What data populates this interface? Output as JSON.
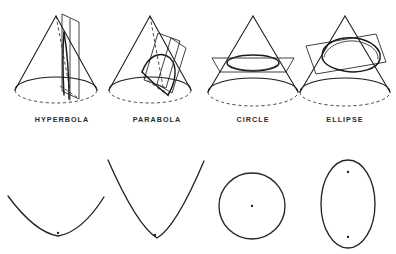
{
  "figure": {
    "background_color": "#ffffff",
    "ink_color": "#1a1a1a",
    "width": 396,
    "height": 254
  },
  "labels": [
    {
      "id": "hyperbola",
      "text": "HYPERBOLA",
      "x": 62,
      "y": 122
    },
    {
      "id": "parabola",
      "text": "PARABOLA",
      "x": 157,
      "y": 122
    },
    {
      "id": "circle",
      "text": "CIRCLE",
      "x": 253,
      "y": 122
    },
    {
      "id": "ellipse",
      "text": "ELLIPSE",
      "x": 345,
      "y": 122
    }
  ],
  "cones": [
    {
      "id": "cone-hyperbola",
      "label": "HYPERBOLA",
      "cut": "vertical plane parallel to cone axis",
      "apex": {
        "x": 56,
        "y": 16
      },
      "base_center": {
        "x": 56,
        "y": 90
      },
      "base_rx": 41,
      "base_ry": 13
    },
    {
      "id": "cone-parabola",
      "label": "PARABOLA",
      "cut": "plane parallel to one slant side",
      "apex": {
        "x": 150,
        "y": 16
      },
      "base_center": {
        "x": 150,
        "y": 90
      },
      "base_rx": 41,
      "base_ry": 13
    },
    {
      "id": "cone-circle",
      "label": "CIRCLE",
      "cut": "horizontal plane perpendicular to cone axis",
      "apex": {
        "x": 253,
        "y": 16
      },
      "base_center": {
        "x": 253,
        "y": 92
      },
      "base_rx": 45,
      "base_ry": 14
    },
    {
      "id": "cone-ellipse",
      "label": "ELLIPSE",
      "cut": "oblique plane tilted across the cone",
      "apex": {
        "x": 345,
        "y": 16
      },
      "base_center": {
        "x": 345,
        "y": 92
      },
      "base_rx": 45,
      "base_ry": 14
    }
  ],
  "curves": [
    {
      "id": "curve-hyperbola",
      "type": "hyperbola-branch",
      "description": "wide shallow upward-opening branch with one focus",
      "foci": [
        {
          "x": 58,
          "y": 233
        }
      ]
    },
    {
      "id": "curve-parabola",
      "type": "parabola",
      "description": "narrow steep upward-opening curve with focus",
      "foci": [
        {
          "x": 155,
          "y": 235
        }
      ]
    },
    {
      "id": "curve-circle",
      "type": "circle",
      "description": "circle with center point",
      "center": {
        "x": 252,
        "y": 206
      },
      "radius": 33,
      "foci": [
        {
          "x": 252,
          "y": 206
        }
      ]
    },
    {
      "id": "curve-ellipse",
      "type": "ellipse",
      "description": "vertical ellipse with two foci",
      "center": {
        "x": 348,
        "y": 204
      },
      "rx": 27,
      "ry": 44,
      "foci": [
        {
          "x": 348,
          "y": 172
        },
        {
          "x": 348,
          "y": 237
        }
      ]
    }
  ]
}
